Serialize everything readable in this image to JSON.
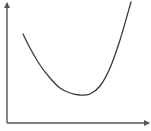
{
  "chart_data": {
    "type": "line",
    "title": "",
    "xlabel": "",
    "ylabel": "",
    "grid": false,
    "legend": null,
    "ticks": false,
    "xlim": [
      0,
      142
    ],
    "ylim": [
      0,
      121
    ],
    "series": [
      {
        "name": "curve",
        "color": "#3a3a3a",
        "x": [
          16,
          23,
          33,
          43,
          53,
          63,
          73,
          83,
          93,
          103,
          113,
          124
        ],
        "y": [
          89,
          75,
          58,
          45,
          35,
          30,
          28,
          29,
          37,
          55,
          83,
          121
        ]
      }
    ]
  },
  "style": {
    "axis_color": "#555555",
    "curve_color": "#3a3a3a",
    "background": "#ffffff"
  }
}
